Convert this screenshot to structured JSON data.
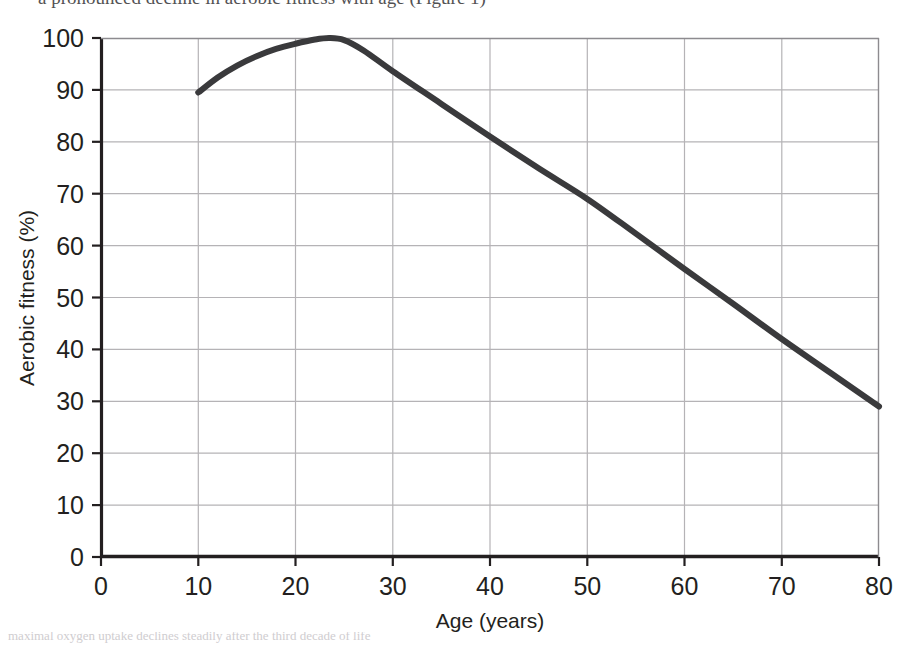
{
  "page": {
    "top_caption": "a pronounced decline in aerobic fitness with age (Figure 1)",
    "bottom_caption": "maximal oxygen uptake declines steadily after the third decade of life"
  },
  "chart_data": {
    "type": "line",
    "title": "",
    "subtitle": "",
    "xlabel": "Age (years)",
    "ylabel": "Aerobic fitness (%)",
    "xlim": [
      0,
      80
    ],
    "ylim": [
      0,
      100
    ],
    "xticks": [
      0,
      10,
      20,
      30,
      40,
      50,
      60,
      70,
      80
    ],
    "yticks": [
      0,
      10,
      20,
      30,
      40,
      50,
      60,
      70,
      80,
      90,
      100
    ],
    "xtick_labels": [
      "0",
      "10",
      "20",
      "30",
      "40",
      "50",
      "60",
      "70",
      "80"
    ],
    "ytick_labels": [
      "0",
      "10",
      "20",
      "30",
      "40",
      "50",
      "60",
      "70",
      "80",
      "90",
      "100"
    ],
    "grid": true,
    "grid_color": "#b5b3b6",
    "legend": false,
    "legend_position": "none",
    "line_color": "#3a3a3c",
    "line_width": 6,
    "series": [
      {
        "name": "Aerobic fitness",
        "x": [
          10,
          12,
          14,
          16,
          18,
          20,
          22,
          23.5,
          25,
          27,
          30,
          35,
          40,
          45,
          50,
          55,
          60,
          65,
          70,
          75,
          80
        ],
        "values": [
          89.5,
          92.4,
          94.7,
          96.5,
          97.9,
          98.9,
          99.7,
          100,
          99.6,
          97.6,
          93.6,
          87.3,
          81.0,
          74.9,
          69.0,
          62.3,
          55.5,
          48.8,
          42.0,
          35.5,
          29.0
        ]
      }
    ],
    "annotations": [
      {
        "text": "peak",
        "x": 23.5,
        "y": 100
      }
    ]
  }
}
